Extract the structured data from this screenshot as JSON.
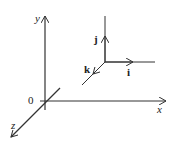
{
  "diagram": {
    "axes": {
      "x_label": "x",
      "y_label": "y",
      "z_label": "z",
      "origin_label": "0"
    },
    "unit_vectors": {
      "i_label": "i",
      "j_label": "j",
      "k_label": "k"
    },
    "colors": {
      "stroke": "#333333",
      "background": "#ffffff"
    }
  }
}
